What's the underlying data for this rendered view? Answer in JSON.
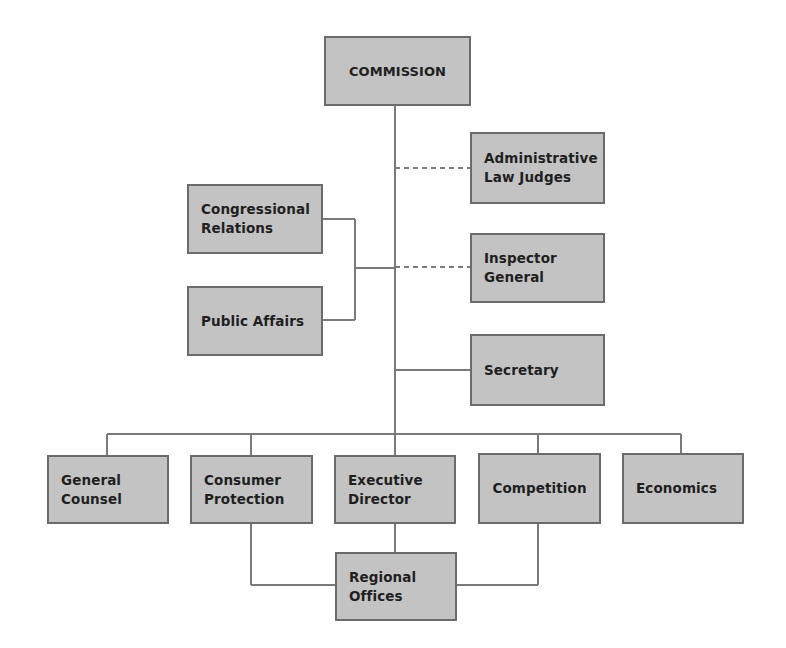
{
  "diagram": {
    "type": "organizational-chart",
    "colors": {
      "box_fill": "#c3c3c3",
      "box_border": "#6b6b6b",
      "line": "#7a7a7a",
      "text": "#1f1f1f"
    },
    "nodes": {
      "commission": {
        "label": "COMMISSION"
      },
      "admin_law_judges": {
        "label": "Administrative\nLaw Judges"
      },
      "congressional_relations": {
        "label": "Congressional\nRelations"
      },
      "public_affairs": {
        "label": "Public Affairs"
      },
      "inspector_general": {
        "label": "Inspector\nGeneral"
      },
      "secretary": {
        "label": "Secretary"
      },
      "general_counsel": {
        "label": "General\nCounsel"
      },
      "consumer_protection": {
        "label": "Consumer\nProtection"
      },
      "executive_director": {
        "label": "Executive\nDirector"
      },
      "competition": {
        "label": "Competition"
      },
      "economics": {
        "label": "Economics"
      },
      "regional_offices": {
        "label": "Regional\nOffices"
      }
    },
    "edges": [
      {
        "from": "commission",
        "to": "admin_law_judges",
        "style": "dashed"
      },
      {
        "from": "commission",
        "to": "congressional_relations",
        "style": "solid"
      },
      {
        "from": "commission",
        "to": "public_affairs",
        "style": "solid"
      },
      {
        "from": "commission",
        "to": "inspector_general",
        "style": "dashed"
      },
      {
        "from": "commission",
        "to": "secretary",
        "style": "solid"
      },
      {
        "from": "commission",
        "to": "general_counsel",
        "style": "solid"
      },
      {
        "from": "commission",
        "to": "consumer_protection",
        "style": "solid"
      },
      {
        "from": "commission",
        "to": "executive_director",
        "style": "solid"
      },
      {
        "from": "commission",
        "to": "competition",
        "style": "solid"
      },
      {
        "from": "commission",
        "to": "economics",
        "style": "solid"
      },
      {
        "from": "consumer_protection",
        "to": "regional_offices",
        "style": "solid"
      },
      {
        "from": "executive_director",
        "to": "regional_offices",
        "style": "solid"
      },
      {
        "from": "competition",
        "to": "regional_offices",
        "style": "solid"
      }
    ]
  }
}
